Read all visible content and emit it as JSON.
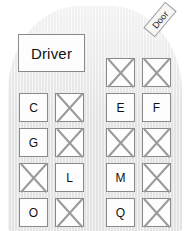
{
  "diagram": {
    "vehicle_color": "#e6e6e6",
    "box_fill": "#fdfdfd",
    "box_border": "#8a8a8a",
    "cross_color": "#9a9a9a"
  },
  "driver": {
    "label": "Driver"
  },
  "door": {
    "label": "Door"
  },
  "legend": {
    "crossed_meaning": "X"
  },
  "seats": {
    "left_column": [
      {
        "row": 1,
        "a": {
          "label": "C",
          "state": "labeled"
        },
        "b": {
          "label": "X",
          "state": "crossed"
        }
      },
      {
        "row": 2,
        "a": {
          "label": "G",
          "state": "labeled"
        },
        "b": {
          "label": "X",
          "state": "crossed"
        }
      },
      {
        "row": 3,
        "a": {
          "label": "X",
          "state": "crossed"
        },
        "b": {
          "label": "L",
          "state": "labeled"
        }
      },
      {
        "row": 4,
        "a": {
          "label": "O",
          "state": "labeled"
        },
        "b": {
          "label": "X",
          "state": "crossed"
        }
      }
    ],
    "right_column": [
      {
        "row": 1,
        "a": {
          "label": "X",
          "state": "crossed"
        },
        "b": {
          "label": "X",
          "state": "crossed"
        }
      },
      {
        "row": 2,
        "a": {
          "label": "E",
          "state": "labeled"
        },
        "b": {
          "label": "F",
          "state": "labeled"
        }
      },
      {
        "row": 3,
        "a": {
          "label": "X",
          "state": "crossed"
        },
        "b": {
          "label": "X",
          "state": "crossed"
        }
      },
      {
        "row": 4,
        "a": {
          "label": "M",
          "state": "labeled"
        },
        "b": {
          "label": "X",
          "state": "crossed"
        }
      },
      {
        "row": 5,
        "a": {
          "label": "Q",
          "state": "labeled"
        },
        "b": {
          "label": "X",
          "state": "crossed"
        }
      }
    ]
  }
}
